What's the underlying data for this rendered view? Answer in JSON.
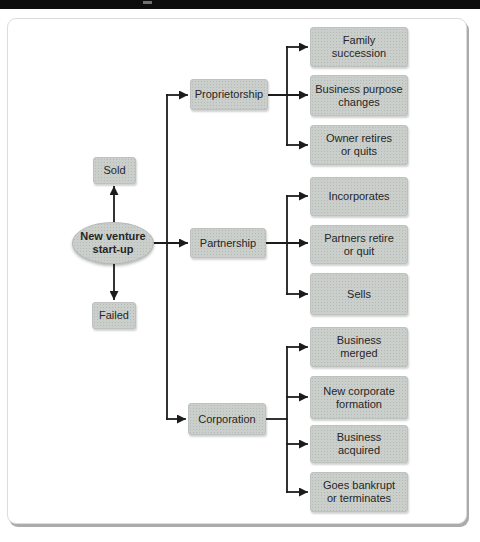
{
  "header": {
    "bar": ""
  },
  "colors": {
    "bar": "#0d0d0d",
    "node_fill": "#cbcfcb",
    "node_dot": "#b6bab6",
    "node_text": "#262626",
    "line": "#1c1c1c",
    "panel_border": "#dcdcdc",
    "panel_shadow": "#ababab"
  },
  "diagram": {
    "root": {
      "label": "New venture\nstart-up"
    },
    "outcomes": [
      {
        "label": "Sold"
      },
      {
        "label": "Failed"
      }
    ],
    "branches": [
      {
        "label": "Proprietorship",
        "children": [
          {
            "label": "Family\nsuccession"
          },
          {
            "label": "Business purpose\nchanges"
          },
          {
            "label": "Owner retires\nor quits"
          }
        ]
      },
      {
        "label": "Partnership",
        "children": [
          {
            "label": "Incorporates"
          },
          {
            "label": "Partners retire\nor quit"
          },
          {
            "label": "Sells"
          }
        ]
      },
      {
        "label": "Corporation",
        "children": [
          {
            "label": "Business\nmerged"
          },
          {
            "label": "New corporate\nformation"
          },
          {
            "label": "Business\nacquired"
          },
          {
            "label": "Goes bankrupt\nor terminates"
          }
        ]
      }
    ]
  }
}
